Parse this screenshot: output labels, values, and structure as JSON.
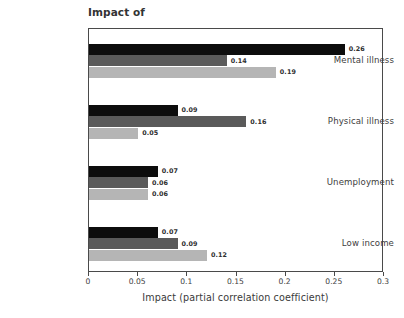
{
  "chart_data": {
    "type": "bar",
    "orientation": "horizontal",
    "title": "Impact of",
    "xlabel": "Impact (partial correlation coefficient)",
    "ylabel": "",
    "xlim": [
      0,
      0.3
    ],
    "xticks": [
      "0",
      "0.05",
      "0.1",
      "0.15",
      "0.2",
      "0.25",
      "0.3"
    ],
    "xtick_values": [
      0,
      0.05,
      0.1,
      0.15,
      0.2,
      0.25,
      0.3
    ],
    "grid": false,
    "legend": "none",
    "categories": [
      "Mental illness",
      "Physical illness",
      "Unemployment",
      "Low income"
    ],
    "series": [
      {
        "name": "series-1",
        "color": "#0d0d0d",
        "values": [
          0.26,
          0.09,
          0.07,
          0.07
        ],
        "labels": [
          "0.26",
          "0.09",
          "0.07",
          "0.07"
        ]
      },
      {
        "name": "series-2",
        "color": "#5a5a5a",
        "values": [
          0.14,
          0.16,
          0.06,
          0.09
        ],
        "labels": [
          "0.14",
          "0.16",
          "0.06",
          "0.09"
        ]
      },
      {
        "name": "series-3",
        "color": "#b5b5b5",
        "values": [
          0.19,
          0.05,
          0.06,
          0.12
        ],
        "labels": [
          "0.19",
          "0.05",
          "0.06",
          "0.12"
        ]
      }
    ]
  },
  "colors": {
    "background": "#ffffff",
    "frame": "#4a4a4a",
    "text": "#3a3a3a",
    "bar_dark": "#0d0d0d",
    "bar_mid": "#5a5a5a",
    "bar_light": "#b5b5b5"
  }
}
